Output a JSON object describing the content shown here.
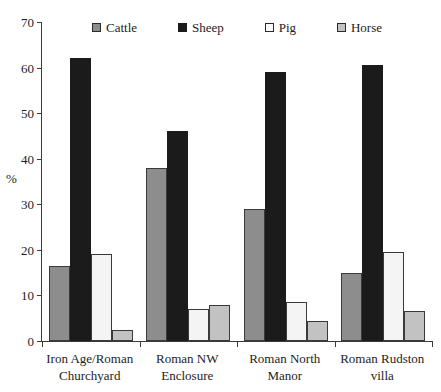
{
  "chart_data": {
    "type": "bar",
    "title": "",
    "xlabel": "",
    "ylabel": "%",
    "ylim": [
      0,
      70
    ],
    "yticks": [
      0,
      10,
      20,
      30,
      40,
      50,
      60,
      70
    ],
    "grid": false,
    "legend_position": "top",
    "categories": [
      "Iron Age/Roman Churchyard",
      "Roman NW Enclosure",
      "Roman North Manor",
      "Roman Rudston villa"
    ],
    "category_lines": [
      [
        "Iron Age/Roman",
        "Churchyard"
      ],
      [
        "Roman NW",
        "Enclosure"
      ],
      [
        "Roman North",
        "Manor"
      ],
      [
        "Roman Rudston",
        "villa"
      ]
    ],
    "series": [
      {
        "name": "Cattle",
        "color": "#8d8d8d",
        "values": [
          16.5,
          38.0,
          29.0,
          15.0
        ]
      },
      {
        "name": "Sheep",
        "color": "#1b1b1b",
        "values": [
          62.0,
          46.0,
          59.0,
          60.5
        ]
      },
      {
        "name": "Pig",
        "color": "#f4f4f4",
        "values": [
          19.0,
          7.0,
          8.5,
          19.5
        ]
      },
      {
        "name": "Horse",
        "color": "#c2c2c2",
        "values": [
          2.5,
          8.0,
          4.5,
          6.5
        ]
      }
    ]
  },
  "legend": {
    "items": [
      {
        "label": "Cattle"
      },
      {
        "label": "Sheep"
      },
      {
        "label": "Pig"
      },
      {
        "label": "Horse"
      }
    ]
  },
  "axis": {
    "y_title": "%",
    "y_tick_labels": [
      "70",
      "60",
      "50",
      "40",
      "30",
      "20",
      "10",
      "0"
    ]
  }
}
